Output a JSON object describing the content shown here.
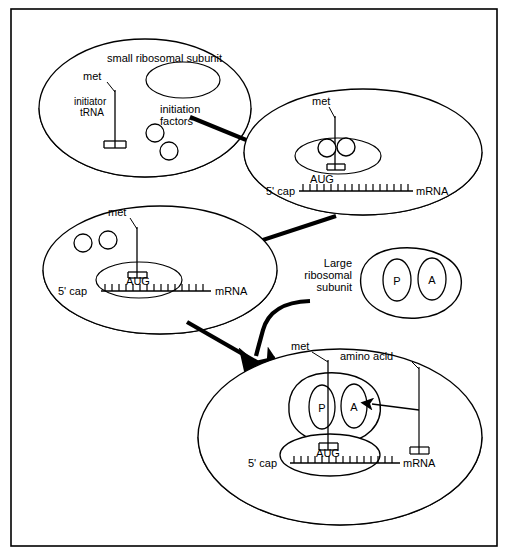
{
  "figure": {
    "frame": {
      "stroke": "#000000",
      "fill": "#ffffff"
    },
    "colors": {
      "line": "#000000",
      "background": "#ffffff",
      "shading": "#888888",
      "arrow": "#000000"
    }
  },
  "stages": [
    {
      "id": "stage-1",
      "name": "small-ribosomal-subunit",
      "labels": {
        "subunit": "small ribosomal subunit",
        "met": "met",
        "initiator_trna_line1": "initiator",
        "initiator_trna_line2": "tRNA",
        "initiation_factors_line1": "initiation",
        "initiation_factors_line2": "factors"
      },
      "factor_count": 2
    },
    {
      "id": "stage-2",
      "name": "subunit-bound-to-mrna-with-factors",
      "labels": {
        "met": "met",
        "cap": "5' cap",
        "codon": "AUG",
        "mrna": "mRNA"
      },
      "factor_count": 2
    },
    {
      "id": "stage-3",
      "name": "factors-released-start-codon-found",
      "labels": {
        "met": "met",
        "cap": "5' cap",
        "codon": "AUG",
        "mrna": "mRNA"
      },
      "factor_count": 2
    },
    {
      "id": "stage-large-subunit",
      "name": "large-ribosomal-subunit",
      "labels": {
        "title_line1": "Large",
        "title_line2": "ribosomal",
        "title_line3": "subunit",
        "site_p": "P",
        "site_a": "A"
      }
    },
    {
      "id": "stage-4",
      "name": "complete-ribosome-with-amino-acid-trna",
      "labels": {
        "met": "met",
        "amino_acid_line1": "amino",
        "amino_acid_line2": "acid",
        "amino_acid": "amino  acid",
        "cap": "5' cap",
        "codon": "AUG",
        "mrna": "mRNA",
        "site_p": "P",
        "site_a": "A"
      }
    }
  ],
  "arrows": [
    {
      "name": "arrow-stage1-to-stage2",
      "kind": "straight",
      "direction": "down-right"
    },
    {
      "name": "arrow-stage2-to-stage3",
      "kind": "straight",
      "direction": "down-left"
    },
    {
      "name": "arrow-stage3-to-stage4",
      "kind": "straight",
      "direction": "down-right"
    },
    {
      "name": "arrow-large-subunit-joins",
      "kind": "curved",
      "direction": "down-left"
    },
    {
      "name": "arrow-amino-acid-to-a-site",
      "kind": "thin",
      "direction": "left"
    }
  ]
}
